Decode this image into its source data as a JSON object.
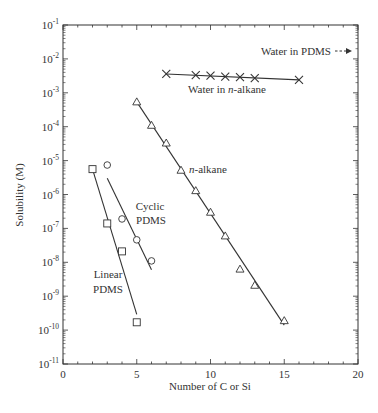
{
  "chart_data": {
    "type": "scatter",
    "title": "",
    "xlabel": "Number of C or Si",
    "ylabel": "Solubility (M)",
    "xlim": [
      0,
      20
    ],
    "ylim": [
      1e-11,
      0.1
    ],
    "yscale": "log",
    "grid": false,
    "legend": "none (inline labels)",
    "x_ticks": [
      "0",
      "5",
      "10",
      "15",
      "20"
    ],
    "y_ticks": [
      "10^-1",
      "10^-2",
      "10^-3",
      "10^-4",
      "10^-5",
      "10^-6",
      "10^-7",
      "10^-8",
      "10^-9",
      "10^-10",
      "10^-11"
    ],
    "series": [
      {
        "name": "Water in n-alkane",
        "marker": "cross",
        "x": [
          7,
          9,
          10,
          11,
          12,
          13,
          16
        ],
        "y": [
          0.0036,
          0.0033,
          0.0032,
          0.003,
          0.0029,
          0.0027,
          0.0024
        ],
        "fit_line": {
          "x": [
            7,
            16
          ],
          "y": [
            0.0036,
            0.0024
          ]
        }
      },
      {
        "name": "n-alkane",
        "marker": "triangle",
        "x": [
          5,
          6,
          7,
          8,
          9,
          10,
          11,
          12,
          13,
          15
        ],
        "y": [
          0.00054,
          0.00011,
          3.3e-05,
          5.2e-06,
          1.3e-06,
          3e-07,
          6e-08,
          6.3e-09,
          2.1e-09,
          1.9e-10
        ],
        "fit_line": {
          "x": [
            5,
            15
          ],
          "y": [
            0.00054,
            1.4e-10
          ]
        }
      },
      {
        "name": "Cyclic PDMS",
        "marker": "circle",
        "x": [
          3,
          4,
          5,
          6
        ],
        "y": [
          7.4e-06,
          1.9e-07,
          4.6e-08,
          1.1e-08
        ],
        "fit_line": {
          "x": [
            3,
            6
          ],
          "y": [
            3e-06,
            6e-09
          ]
        }
      },
      {
        "name": "Linear PDMS",
        "marker": "square",
        "x": [
          2,
          3,
          4,
          5
        ],
        "y": [
          5.6e-06,
          1.4e-07,
          2.1e-08,
          1.7e-10
        ],
        "fit_line": {
          "x": [
            2,
            5
          ],
          "y": [
            5.6e-06,
            2.9e-10
          ]
        }
      }
    ],
    "annotations": [
      {
        "text": "Water in PDMS",
        "arrow": "dashed, pointing right (off-scale above)",
        "approx_y": 0.012
      },
      {
        "text": "Water in n-alkane"
      },
      {
        "text": "n-alkane"
      },
      {
        "text": "Cyclic PDMS"
      },
      {
        "text": "Linear PDMS"
      }
    ]
  },
  "labels": {
    "xlabel": "Number of C or Si",
    "ylabel": "Solubility (M)",
    "water_pdms": "Water in PDMS",
    "water_nalkane_prefix": "Water in ",
    "water_nalkane_italic": "n",
    "water_nalkane_suffix": "-alkane",
    "nalkane_italic": "n",
    "nalkane_suffix": "-alkane",
    "cyclic_1": "Cyclic",
    "cyclic_2": "PDMS",
    "linear_1": "Linear",
    "linear_2": "PDMS",
    "xticks": [
      "0",
      "5",
      "10",
      "15",
      "20"
    ],
    "yexp": [
      "-1",
      "-2",
      "-3",
      "-4",
      "-5",
      "-6",
      "-7",
      "-8",
      "-9",
      "-10",
      "-11"
    ],
    "ybase": "10"
  }
}
